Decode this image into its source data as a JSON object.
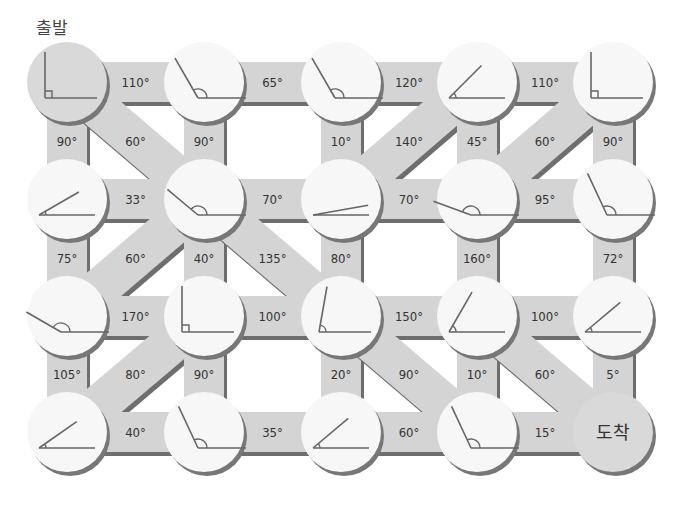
{
  "start_label": "출발",
  "end_label": "도착",
  "colors": {
    "road": "#d4d4d4",
    "road_edge": "#6e6e6e",
    "circle": "#f7f7f7",
    "circle_special": "#d9d9d9",
    "circle_shadow": "#777777",
    "line": "#666666",
    "text": "#333333"
  },
  "grid": {
    "cols": 5,
    "rows": 4
  },
  "nodes": [
    {
      "row": 0,
      "col": 0,
      "angle": 90,
      "type": "start"
    },
    {
      "row": 0,
      "col": 1,
      "angle": 120
    },
    {
      "row": 0,
      "col": 2,
      "angle": 120
    },
    {
      "row": 0,
      "col": 3,
      "angle": 45
    },
    {
      "row": 0,
      "col": 4,
      "angle": 90
    },
    {
      "row": 1,
      "col": 0,
      "angle": 30
    },
    {
      "row": 1,
      "col": 1,
      "angle": 140
    },
    {
      "row": 1,
      "col": 2,
      "angle": 10
    },
    {
      "row": 1,
      "col": 3,
      "angle": 160
    },
    {
      "row": 1,
      "col": 4,
      "angle": 115
    },
    {
      "row": 2,
      "col": 0,
      "angle": 150
    },
    {
      "row": 2,
      "col": 1,
      "angle": 90
    },
    {
      "row": 2,
      "col": 2,
      "angle": 80
    },
    {
      "row": 2,
      "col": 3,
      "angle": 60
    },
    {
      "row": 2,
      "col": 4,
      "angle": 40
    },
    {
      "row": 3,
      "col": 0,
      "angle": 35
    },
    {
      "row": 3,
      "col": 1,
      "angle": 115
    },
    {
      "row": 3,
      "col": 2,
      "angle": 40
    },
    {
      "row": 3,
      "col": 3,
      "angle": 115
    },
    {
      "row": 3,
      "col": 4,
      "angle": null,
      "type": "end"
    }
  ],
  "edges": [
    {
      "from": [
        0,
        0
      ],
      "to": [
        0,
        1
      ],
      "label": "110°"
    },
    {
      "from": [
        0,
        1
      ],
      "to": [
        0,
        2
      ],
      "label": "65°"
    },
    {
      "from": [
        0,
        2
      ],
      "to": [
        0,
        3
      ],
      "label": "120°"
    },
    {
      "from": [
        0,
        3
      ],
      "to": [
        0,
        4
      ],
      "label": "110°"
    },
    {
      "from": [
        0,
        0
      ],
      "to": [
        1,
        0
      ],
      "label": "90°"
    },
    {
      "from": [
        0,
        0
      ],
      "to": [
        1,
        1
      ],
      "label": "60°"
    },
    {
      "from": [
        0,
        1
      ],
      "to": [
        1,
        1
      ],
      "label": "90°"
    },
    {
      "from": [
        0,
        2
      ],
      "to": [
        1,
        2
      ],
      "label": "10°"
    },
    {
      "from": [
        0,
        3
      ],
      "to": [
        1,
        2
      ],
      "label": "140°"
    },
    {
      "from": [
        0,
        3
      ],
      "to": [
        1,
        3
      ],
      "label": "45°"
    },
    {
      "from": [
        0,
        4
      ],
      "to": [
        1,
        3
      ],
      "label": "60°"
    },
    {
      "from": [
        0,
        4
      ],
      "to": [
        1,
        4
      ],
      "label": "90°"
    },
    {
      "from": [
        1,
        0
      ],
      "to": [
        1,
        1
      ],
      "label": "33°"
    },
    {
      "from": [
        1,
        1
      ],
      "to": [
        1,
        2
      ],
      "label": "70°"
    },
    {
      "from": [
        1,
        2
      ],
      "to": [
        1,
        3
      ],
      "label": "70°"
    },
    {
      "from": [
        1,
        3
      ],
      "to": [
        1,
        4
      ],
      "label": "95°"
    },
    {
      "from": [
        1,
        0
      ],
      "to": [
        2,
        0
      ],
      "label": "75°"
    },
    {
      "from": [
        1,
        1
      ],
      "to": [
        2,
        0
      ],
      "label": "60°"
    },
    {
      "from": [
        1,
        1
      ],
      "to": [
        2,
        1
      ],
      "label": "40°"
    },
    {
      "from": [
        1,
        1
      ],
      "to": [
        2,
        2
      ],
      "label": "135°"
    },
    {
      "from": [
        1,
        2
      ],
      "to": [
        2,
        2
      ],
      "label": "80°"
    },
    {
      "from": [
        1,
        3
      ],
      "to": [
        2,
        3
      ],
      "label": "160°"
    },
    {
      "from": [
        1,
        4
      ],
      "to": [
        2,
        4
      ],
      "label": "72°"
    },
    {
      "from": [
        2,
        0
      ],
      "to": [
        2,
        1
      ],
      "label": "170°"
    },
    {
      "from": [
        2,
        1
      ],
      "to": [
        2,
        2
      ],
      "label": "100°"
    },
    {
      "from": [
        2,
        2
      ],
      "to": [
        2,
        3
      ],
      "label": "150°"
    },
    {
      "from": [
        2,
        3
      ],
      "to": [
        2,
        4
      ],
      "label": "100°"
    },
    {
      "from": [
        2,
        0
      ],
      "to": [
        3,
        0
      ],
      "label": "105°"
    },
    {
      "from": [
        2,
        1
      ],
      "to": [
        3,
        0
      ],
      "label": "80°"
    },
    {
      "from": [
        2,
        1
      ],
      "to": [
        3,
        1
      ],
      "label": "90°"
    },
    {
      "from": [
        2,
        2
      ],
      "to": [
        3,
        2
      ],
      "label": "20°"
    },
    {
      "from": [
        2,
        2
      ],
      "to": [
        3,
        3
      ],
      "label": "90°"
    },
    {
      "from": [
        2,
        3
      ],
      "to": [
        3,
        3
      ],
      "label": "10°"
    },
    {
      "from": [
        2,
        3
      ],
      "to": [
        3,
        4
      ],
      "label": "60°"
    },
    {
      "from": [
        2,
        4
      ],
      "to": [
        3,
        4
      ],
      "label": "5°"
    },
    {
      "from": [
        3,
        0
      ],
      "to": [
        3,
        1
      ],
      "label": "40°"
    },
    {
      "from": [
        3,
        1
      ],
      "to": [
        3,
        2
      ],
      "label": "35°"
    },
    {
      "from": [
        3,
        2
      ],
      "to": [
        3,
        3
      ],
      "label": "60°"
    },
    {
      "from": [
        3,
        3
      ],
      "to": [
        3,
        4
      ],
      "label": "15°"
    }
  ]
}
